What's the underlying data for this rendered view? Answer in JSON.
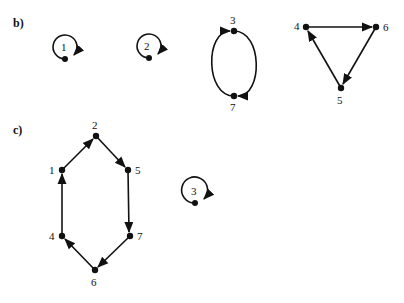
{
  "panels": [
    {
      "label": "b)",
      "cycles": [
        {
          "type": "fixed-point",
          "nodes": [
            "1"
          ]
        },
        {
          "type": "fixed-point",
          "nodes": [
            "2"
          ]
        },
        {
          "type": "cycle",
          "nodes": [
            "3",
            "7"
          ]
        },
        {
          "type": "cycle",
          "nodes": [
            "4",
            "6",
            "5"
          ]
        }
      ],
      "node_labels": {
        "n1": "1",
        "n2": "2",
        "n3": "3",
        "n7": "7",
        "n4": "4",
        "n6": "6",
        "n5": "5"
      }
    },
    {
      "label": "c)",
      "cycles": [
        {
          "type": "cycle",
          "nodes": [
            "1",
            "2",
            "5",
            "7",
            "6",
            "4"
          ]
        },
        {
          "type": "fixed-point",
          "nodes": [
            "3"
          ]
        }
      ],
      "node_labels": {
        "n1": "1",
        "n2": "2",
        "n5": "5",
        "n7": "7",
        "n6": "6",
        "n4": "4",
        "n3": "3"
      }
    }
  ],
  "colors": {
    "ink": "#111111",
    "background": "#ffffff"
  }
}
